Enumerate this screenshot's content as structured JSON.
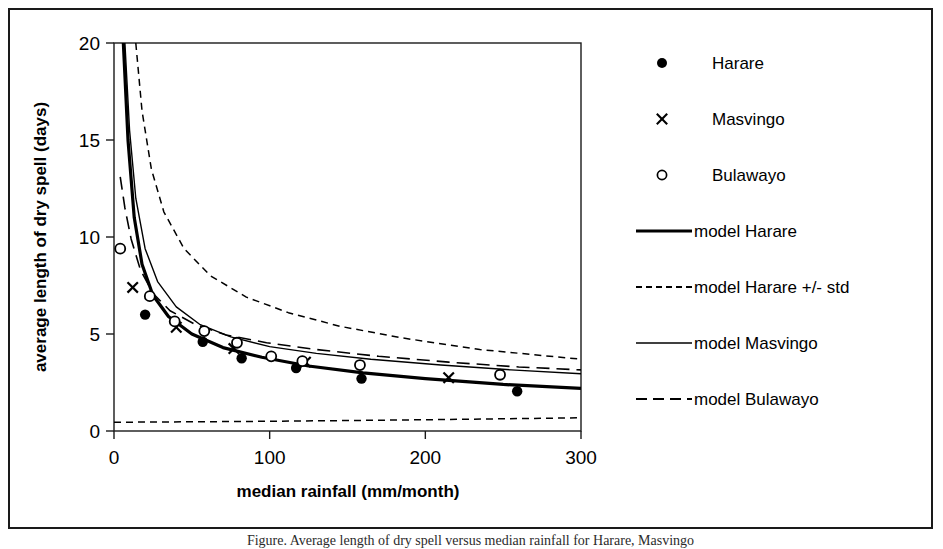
{
  "figure": {
    "border_color": "#1a1a1a",
    "background": "#ffffff",
    "caption": "Figure. Average length of dry spell versus median rainfall for Harare, Masvingo"
  },
  "chart_data": {
    "type": "scatter",
    "title": "",
    "xlabel": "median rainfall (mm/month)",
    "ylabel": "average length of dry spell (days)",
    "xlim": [
      0,
      300
    ],
    "ylim": [
      0,
      20
    ],
    "xticks": [
      0,
      100,
      200,
      300
    ],
    "yticks": [
      0,
      5,
      10,
      15,
      20
    ],
    "xtick_labels": [
      "0",
      "100",
      "200",
      "300"
    ],
    "ytick_labels": [
      "0",
      "5",
      "10",
      "15",
      "20"
    ],
    "grid": false,
    "legend_position": "right",
    "series": [
      {
        "name": "Harare",
        "kind": "scatter",
        "marker": "filled-circle",
        "color": "#000000",
        "points": [
          {
            "x": 20,
            "y": 6.0
          },
          {
            "x": 57,
            "y": 4.6
          },
          {
            "x": 82,
            "y": 3.75
          },
          {
            "x": 117,
            "y": 3.25
          },
          {
            "x": 159,
            "y": 2.7
          },
          {
            "x": 259,
            "y": 2.05
          }
        ]
      },
      {
        "name": "Masvingo",
        "kind": "scatter",
        "marker": "cross",
        "color": "#000000",
        "points": [
          {
            "x": 12,
            "y": 7.4
          },
          {
            "x": 40,
            "y": 5.35
          },
          {
            "x": 77,
            "y": 4.25
          },
          {
            "x": 123,
            "y": 3.55
          },
          {
            "x": 215,
            "y": 2.75
          }
        ]
      },
      {
        "name": "Bulawayo",
        "kind": "scatter",
        "marker": "open-circle",
        "color": "#000000",
        "points": [
          {
            "x": 4,
            "y": 9.4
          },
          {
            "x": 23,
            "y": 6.95
          },
          {
            "x": 39,
            "y": 5.65
          },
          {
            "x": 58,
            "y": 5.15
          },
          {
            "x": 79,
            "y": 4.55
          },
          {
            "x": 101,
            "y": 3.85
          },
          {
            "x": 121,
            "y": 3.6
          },
          {
            "x": 158,
            "y": 3.4
          },
          {
            "x": 248,
            "y": 2.9
          }
        ]
      },
      {
        "name": "model Harare",
        "kind": "line",
        "style": "solid-thick",
        "color": "#000000",
        "points": [
          {
            "x": 6,
            "y": 20.0
          },
          {
            "x": 9,
            "y": 15.0
          },
          {
            "x": 13,
            "y": 11.0
          },
          {
            "x": 18,
            "y": 8.6
          },
          {
            "x": 25,
            "y": 7.0
          },
          {
            "x": 35,
            "y": 5.9
          },
          {
            "x": 50,
            "y": 5.0
          },
          {
            "x": 70,
            "y": 4.3
          },
          {
            "x": 95,
            "y": 3.8
          },
          {
            "x": 125,
            "y": 3.35
          },
          {
            "x": 160,
            "y": 3.0
          },
          {
            "x": 200,
            "y": 2.7
          },
          {
            "x": 250,
            "y": 2.4
          },
          {
            "x": 300,
            "y": 2.2
          }
        ]
      },
      {
        "name": "model Harare +/- std",
        "kind": "line",
        "style": "dashed-upper",
        "color": "#000000",
        "points": [
          {
            "x": 14,
            "y": 20.0
          },
          {
            "x": 18,
            "y": 16.5
          },
          {
            "x": 24,
            "y": 13.5
          },
          {
            "x": 32,
            "y": 11.3
          },
          {
            "x": 45,
            "y": 9.4
          },
          {
            "x": 62,
            "y": 8.0
          },
          {
            "x": 85,
            "y": 6.9
          },
          {
            "x": 112,
            "y": 6.1
          },
          {
            "x": 145,
            "y": 5.4
          },
          {
            "x": 185,
            "y": 4.8
          },
          {
            "x": 235,
            "y": 4.2
          },
          {
            "x": 300,
            "y": 3.7
          }
        ]
      },
      {
        "name": "model Harare - std",
        "kind": "line",
        "style": "dashed-lower",
        "color": "#000000",
        "points": [
          {
            "x": 0,
            "y": 0.45
          },
          {
            "x": 100,
            "y": 0.5
          },
          {
            "x": 200,
            "y": 0.58
          },
          {
            "x": 300,
            "y": 0.68
          }
        ]
      },
      {
        "name": "model Masvingo",
        "kind": "line",
        "style": "solid-thin",
        "color": "#000000",
        "points": [
          {
            "x": 7,
            "y": 20.0
          },
          {
            "x": 10,
            "y": 15.5
          },
          {
            "x": 14,
            "y": 12.0
          },
          {
            "x": 20,
            "y": 9.4
          },
          {
            "x": 28,
            "y": 7.7
          },
          {
            "x": 40,
            "y": 6.4
          },
          {
            "x": 55,
            "y": 5.5
          },
          {
            "x": 75,
            "y": 4.85
          },
          {
            "x": 100,
            "y": 4.35
          },
          {
            "x": 130,
            "y": 4.0
          },
          {
            "x": 165,
            "y": 3.7
          },
          {
            "x": 210,
            "y": 3.4
          },
          {
            "x": 255,
            "y": 3.15
          },
          {
            "x": 300,
            "y": 2.95
          }
        ]
      },
      {
        "name": "model Bulawayo",
        "kind": "line",
        "style": "long-dashed",
        "color": "#000000",
        "points": [
          {
            "x": 4,
            "y": 13.1
          },
          {
            "x": 7,
            "y": 11.5
          },
          {
            "x": 11,
            "y": 9.9
          },
          {
            "x": 17,
            "y": 8.3
          },
          {
            "x": 25,
            "y": 7.1
          },
          {
            "x": 36,
            "y": 6.2
          },
          {
            "x": 52,
            "y": 5.5
          },
          {
            "x": 72,
            "y": 4.95
          },
          {
            "x": 98,
            "y": 4.55
          },
          {
            "x": 130,
            "y": 4.2
          },
          {
            "x": 170,
            "y": 3.85
          },
          {
            "x": 215,
            "y": 3.55
          },
          {
            "x": 260,
            "y": 3.3
          },
          {
            "x": 300,
            "y": 3.15
          }
        ]
      }
    ]
  },
  "legend": {
    "items": [
      {
        "label": "Harare",
        "glyph": "filled-circle-marker"
      },
      {
        "label": "Masvingo",
        "glyph": "cross-marker"
      },
      {
        "label": "Bulawayo",
        "glyph": "open-circle-marker"
      },
      {
        "label": "model Harare",
        "glyph": "solid-thick-line"
      },
      {
        "label": "model Harare +/- std",
        "glyph": "short-dashed-line"
      },
      {
        "label": "model Masvingo",
        "glyph": "solid-thin-line"
      },
      {
        "label": "model Bulawayo",
        "glyph": "long-dashed-line"
      }
    ]
  }
}
